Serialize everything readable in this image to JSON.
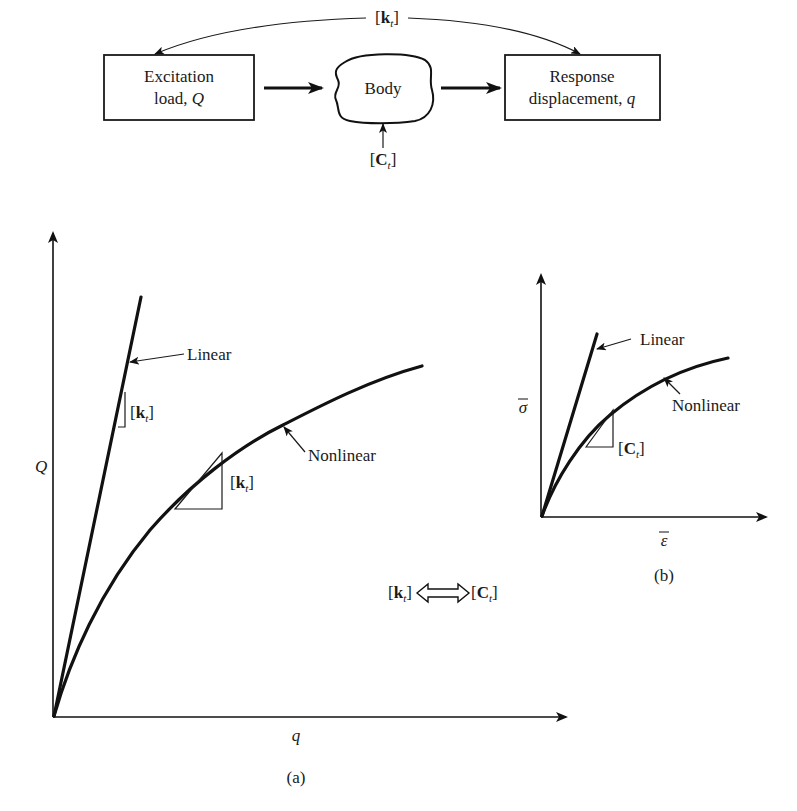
{
  "flow": {
    "top_label": {
      "open": "[",
      "k": "k",
      "sub": "t",
      "close": "]"
    },
    "left_box": {
      "line1": "Excitation",
      "line2_prefix": "load, ",
      "line2_var": "Q"
    },
    "body": {
      "label": "Body"
    },
    "right_box": {
      "line1": "Response",
      "line2_prefix": "displacement, ",
      "line2_var": "q"
    },
    "bottom_label": {
      "open": "[",
      "c": "C",
      "sub": "t",
      "close": "]"
    }
  },
  "figure_a": {
    "y_label": "Q",
    "x_label": "q",
    "caption": "(a)",
    "linear_label": "Linear",
    "nonlinear_label": "Nonlinear",
    "slope_label_linear": {
      "open": "[",
      "k": "k",
      "sub": "t",
      "close": "]"
    },
    "slope_label_nonlinear": {
      "open": "[",
      "k": "k",
      "sub": "t",
      "close": "]"
    },
    "equivalence": {
      "left_k": "k",
      "left_sub": "t",
      "right_c": "C",
      "right_sub": "t",
      "open": "[",
      "close": "]"
    }
  },
  "figure_b": {
    "y_label": "σ",
    "x_label": "ε",
    "caption": "(b)",
    "linear_label": "Linear",
    "nonlinear_label": "Nonlinear",
    "slope_label": {
      "open": "[",
      "c": "C",
      "sub": "t",
      "close": "]"
    }
  },
  "colors": {
    "ink": "#111111",
    "background": "#ffffff"
  }
}
